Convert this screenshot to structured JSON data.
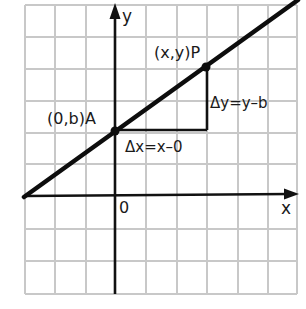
{
  "diagram": {
    "type": "coordinate-plane-line-slope",
    "colors": {
      "background": "#ffffff",
      "grid": "#c8c8c8",
      "axes": "#111111",
      "line": "#0d0d0d",
      "text": "#1a1a1a"
    },
    "axes": {
      "x_label": "x",
      "y_label": "y",
      "origin_label": "0"
    },
    "points": [
      {
        "id": "A",
        "label": "(0,b)A",
        "coords": "(0,b)"
      },
      {
        "id": "P",
        "label": "(x,y)P",
        "coords": "(x,y)"
      }
    ],
    "annotations": {
      "delta_x": "Δx=x–0",
      "delta_y": "Δy=y–b"
    },
    "grid": {
      "columns": 9,
      "rows": 9
    }
  }
}
